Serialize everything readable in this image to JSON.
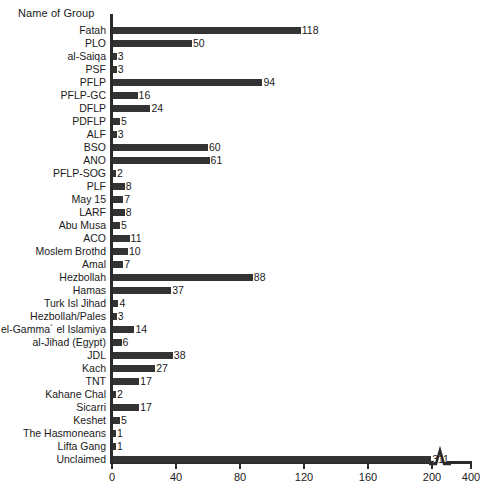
{
  "chart_data": {
    "type": "bar",
    "orientation": "horizontal",
    "title": "Name of Group",
    "xlabel": "",
    "ylabel": "Name of Group",
    "xlim": [
      0,
      400
    ],
    "grid": false,
    "legend": null,
    "bar_color": "#333333",
    "axis_color": "#2b2b2b",
    "axis_break": {
      "after": 200,
      "before": 400,
      "symbol": "zigzag"
    },
    "xticks": [
      0,
      40,
      80,
      120,
      160,
      200,
      400
    ],
    "xtick_labels": [
      "0",
      "40",
      "80",
      "120",
      "160",
      "200",
      "400"
    ],
    "categories": [
      "Fatah",
      "PLO",
      "al-Saiqa",
      "PSF",
      "PFLP",
      "PFLP-GC",
      "DFLP",
      "PDFLP",
      "ALF",
      "BSO",
      "ANO",
      "PFLP-SOG",
      "PLF",
      "May 15",
      "LARF",
      "Abu Musa",
      "ACO",
      "Moslem Brothd",
      "Amal",
      "Hezbollah",
      "Hamas",
      "Turk Isl Jihad",
      "Hezbollah/Pales",
      "el-Gamma´ el Islamiya",
      "al-Jihad (Egypt)",
      "JDL",
      "Kach",
      "TNT",
      "Kahane Chal",
      "Sicarri",
      "Keshet",
      "The Hasmoneans",
      "Lifta Gang",
      "Unclaimed"
    ],
    "values": [
      118,
      50,
      3,
      3,
      94,
      16,
      24,
      5,
      3,
      60,
      61,
      2,
      8,
      7,
      8,
      5,
      11,
      10,
      7,
      88,
      37,
      4,
      3,
      14,
      6,
      38,
      27,
      17,
      2,
      17,
      5,
      1,
      1,
      311
    ],
    "value_labels": [
      "118",
      "50",
      "3",
      "3",
      "94",
      "16",
      "24",
      "5",
      "3",
      "60",
      "61",
      "2",
      "8",
      "7",
      "8",
      "5",
      "11",
      "10",
      "7",
      "88",
      "37",
      "4",
      "3",
      "14",
      "6",
      "38",
      "27",
      "17",
      "2",
      "17",
      "5",
      "1",
      "1",
      "311"
    ]
  }
}
